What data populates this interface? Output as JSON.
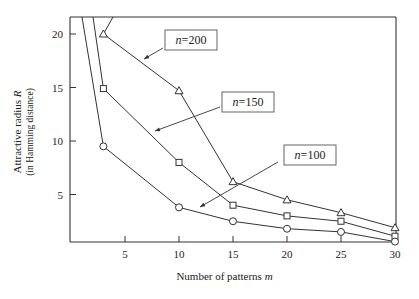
{
  "chart_data": {
    "type": "line",
    "title": "",
    "xlabel": "Number of patterns m",
    "ylabel": "Attractive radius R",
    "ylabel_sub": "(in Hamming distance)",
    "xlim": [
      0,
      30
    ],
    "ylim": [
      0,
      21.5
    ],
    "xticks": [
      5,
      10,
      15,
      20,
      25,
      30
    ],
    "yticks": [
      5,
      10,
      15,
      20
    ],
    "grid": false,
    "legend": "inline annotations with arrows",
    "x": [
      3,
      10,
      15,
      20,
      25,
      30
    ],
    "series": [
      {
        "name": "n=200",
        "marker": "triangle",
        "x": [
          3,
          10,
          15,
          20,
          25,
          30
        ],
        "values": [
          20,
          14.7,
          6.2,
          4.5,
          3.3,
          1.9
        ],
        "label_box": {
          "text": "n=200",
          "x_px": 165,
          "y_px": 30
        }
      },
      {
        "name": "n=150",
        "marker": "square",
        "x": [
          3,
          10,
          15,
          20,
          25,
          30
        ],
        "values": [
          14.9,
          8.0,
          4.0,
          3.0,
          2.5,
          1.1
        ],
        "label_box": {
          "text": "n=150",
          "x_px": 222,
          "y_px": 92
        }
      },
      {
        "name": "n=100",
        "marker": "circle",
        "x": [
          3,
          10,
          15,
          20,
          25,
          30
        ],
        "values": [
          9.5,
          3.8,
          2.5,
          1.8,
          1.5,
          0.6
        ],
        "label_box": {
          "text": "n=100",
          "x_px": 284,
          "y_px": 145
        }
      }
    ]
  },
  "labels": {
    "xlabel": "Number of patterns ",
    "xlabel_var": "m",
    "ylabel": "Attractive  radius ",
    "ylabel_var": "R",
    "ylabel_sub": "(in Hamming distance)",
    "n200": "n=200",
    "n150": "n=150",
    "n100": "n=100"
  }
}
